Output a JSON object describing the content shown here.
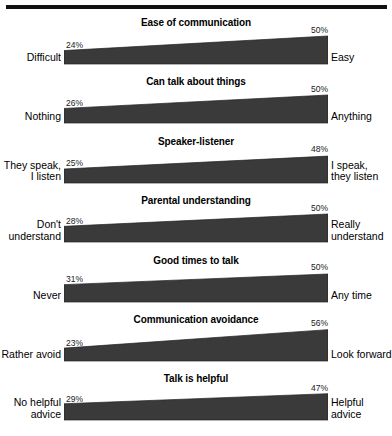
{
  "figure": {
    "background_color": "#ffffff",
    "rule_color": "#111111",
    "bar_fill_color": "#3a3a3a",
    "axis_color": "#1a1a1a",
    "has_top_rule": true
  },
  "chart_data": {
    "type": "bar",
    "title": "",
    "xlabel": "",
    "ylabel": "",
    "note": "Seven horizontal wedge (tapered bar) panels. Each panel shows a percentage at the left end and at the right end of a bar that grows in thickness from left to right. Left and right anchor labels name the poles of each scale.",
    "xlim": [
      0,
      100
    ],
    "grid": false,
    "legend": "none",
    "categories": [
      "Ease of communication",
      "Can talk about things",
      "Speaker-listener",
      "Parental understanding",
      "Good times to talk",
      "Communication avoidance",
      "Talk is helpful"
    ],
    "series": [
      {
        "name": "left end %",
        "values": [
          24,
          26,
          25,
          28,
          31,
          23,
          29
        ]
      },
      {
        "name": "right end %",
        "values": [
          50,
          50,
          48,
          50,
          50,
          56,
          47
        ]
      }
    ],
    "panels": [
      {
        "title": "Ease of communication",
        "left_value": 24,
        "right_value": 50,
        "left_pct_label": "24%",
        "right_pct_label": "50%",
        "left_anchor": "Difficult",
        "right_anchor": "Easy"
      },
      {
        "title": "Can talk about things",
        "left_value": 26,
        "right_value": 50,
        "left_pct_label": "26%",
        "right_pct_label": "50%",
        "left_anchor": "Nothing",
        "right_anchor": "Anything"
      },
      {
        "title": "Speaker-listener",
        "left_value": 25,
        "right_value": 48,
        "left_pct_label": "25%",
        "right_pct_label": "48%",
        "left_anchor": "They speak,\nI listen",
        "right_anchor": "I speak,\nthey listen"
      },
      {
        "title": "Parental understanding",
        "left_value": 28,
        "right_value": 50,
        "left_pct_label": "28%",
        "right_pct_label": "50%",
        "left_anchor": "Don't\nunderstand",
        "right_anchor": "Really\nunderstand"
      },
      {
        "title": "Good times to talk",
        "left_value": 31,
        "right_value": 50,
        "left_pct_label": "31%",
        "right_pct_label": "50%",
        "left_anchor": "Never",
        "right_anchor": "Any time"
      },
      {
        "title": "Communication avoidance",
        "left_value": 23,
        "right_value": 56,
        "left_pct_label": "23%",
        "right_pct_label": "56%",
        "left_anchor": "Rather avoid",
        "right_anchor": "Look forward"
      },
      {
        "title": "Talk is helpful",
        "left_value": 29,
        "right_value": 47,
        "left_pct_label": "29%",
        "right_pct_label": "47%",
        "left_anchor": "No helpful\nadvice",
        "right_anchor": "Helpful\nadvice"
      }
    ]
  }
}
